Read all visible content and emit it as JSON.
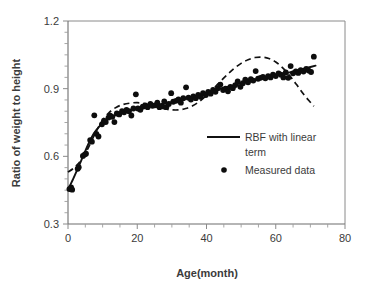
{
  "chart_data": {
    "type": "scatter",
    "title": "",
    "xlabel": "Age(month)",
    "ylabel": "Ratio of weight to height",
    "xlim": [
      0,
      80
    ],
    "ylim": [
      0.3,
      1.2
    ],
    "xticks": [
      0,
      20,
      40,
      60,
      80
    ],
    "xtick_labels": [
      "0",
      "20",
      "40",
      "60",
      "80"
    ],
    "xminor_step": 5,
    "yticks": [
      0.3,
      0.6,
      0.9,
      1.2
    ],
    "ytick_labels": [
      "0.3",
      "0.6",
      "0.9",
      "1.2"
    ],
    "yminor_step": 0.05,
    "grid": false,
    "legend_position": "center-right",
    "legend": [
      {
        "label": "RBF with linear term",
        "style": "line",
        "color": "#111111"
      },
      {
        "label": "Measured data",
        "style": "marker",
        "color": "#0d0d0d"
      }
    ],
    "series": [
      {
        "name": "Measured data",
        "style": "marker",
        "points": [
          [
            0.4,
            0.455
          ],
          [
            0.9,
            0.462
          ],
          [
            1.2,
            0.452
          ],
          [
            2.8,
            0.545
          ],
          [
            3.1,
            0.552
          ],
          [
            4.3,
            0.602
          ],
          [
            4.8,
            0.608
          ],
          [
            5.2,
            0.612
          ],
          [
            6.4,
            0.672
          ],
          [
            6.9,
            0.665
          ],
          [
            7.6,
            0.782
          ],
          [
            8.2,
            0.7
          ],
          [
            8.8,
            0.688
          ],
          [
            9.8,
            0.742
          ],
          [
            10.4,
            0.758
          ],
          [
            10.9,
            0.752
          ],
          [
            11.7,
            0.772
          ],
          [
            12.2,
            0.78
          ],
          [
            12.8,
            0.775
          ],
          [
            13.4,
            0.752
          ],
          [
            14.1,
            0.79
          ],
          [
            14.8,
            0.786
          ],
          [
            15.6,
            0.8
          ],
          [
            16.2,
            0.795
          ],
          [
            16.9,
            0.806
          ],
          [
            17.6,
            0.8
          ],
          [
            18.3,
            0.781
          ],
          [
            18.9,
            0.812
          ],
          [
            19.6,
            0.875
          ],
          [
            20.2,
            0.812
          ],
          [
            20.9,
            0.806
          ],
          [
            21.6,
            0.82
          ],
          [
            22.3,
            0.826
          ],
          [
            23.0,
            0.818
          ],
          [
            23.8,
            0.832
          ],
          [
            24.4,
            0.824
          ],
          [
            25.1,
            0.826
          ],
          [
            25.8,
            0.838
          ],
          [
            26.4,
            0.818
          ],
          [
            27.1,
            0.822
          ],
          [
            27.8,
            0.843
          ],
          [
            28.4,
            0.818
          ],
          [
            29.1,
            0.832
          ],
          [
            29.8,
            0.88
          ],
          [
            30.4,
            0.842
          ],
          [
            31.2,
            0.846
          ],
          [
            31.9,
            0.852
          ],
          [
            32.6,
            0.838
          ],
          [
            33.3,
            0.858
          ],
          [
            34.1,
            0.906
          ],
          [
            34.8,
            0.86
          ],
          [
            35.5,
            0.852
          ],
          [
            36.2,
            0.866
          ],
          [
            36.9,
            0.858
          ],
          [
            37.6,
            0.872
          ],
          [
            38.3,
            0.864
          ],
          [
            39.0,
            0.88
          ],
          [
            39.8,
            0.872
          ],
          [
            40.5,
            0.886
          ],
          [
            41.2,
            0.878
          ],
          [
            41.9,
            0.894
          ],
          [
            42.6,
            0.886
          ],
          [
            43.3,
            0.902
          ],
          [
            44.0,
            0.918
          ],
          [
            44.8,
            0.894
          ],
          [
            45.5,
            0.9
          ],
          [
            46.2,
            0.888
          ],
          [
            46.9,
            0.908
          ],
          [
            47.6,
            0.902
          ],
          [
            48.3,
            0.916
          ],
          [
            49.0,
            0.932
          ],
          [
            49.8,
            0.908
          ],
          [
            50.5,
            0.924
          ],
          [
            51.2,
            0.94
          ],
          [
            52.0,
            0.928
          ],
          [
            52.8,
            0.942
          ],
          [
            53.5,
            0.936
          ],
          [
            54.2,
            0.978
          ],
          [
            54.9,
            0.944
          ],
          [
            55.6,
            0.948
          ],
          [
            56.3,
            0.952
          ],
          [
            57.0,
            0.946
          ],
          [
            57.8,
            0.956
          ],
          [
            58.5,
            0.95
          ],
          [
            59.2,
            0.962
          ],
          [
            60.0,
            0.956
          ],
          [
            60.8,
            0.968
          ],
          [
            61.5,
            0.962
          ],
          [
            62.2,
            0.95
          ],
          [
            62.9,
            0.972
          ],
          [
            63.6,
            0.948
          ],
          [
            64.3,
            1.0
          ],
          [
            65.0,
            0.968
          ],
          [
            65.8,
            0.976
          ],
          [
            66.5,
            0.97
          ],
          [
            67.2,
            0.982
          ],
          [
            68.0,
            0.976
          ],
          [
            68.8,
            0.988
          ],
          [
            69.5,
            0.98
          ],
          [
            70.2,
            0.974
          ],
          [
            71.0,
            1.042
          ]
        ]
      },
      {
        "name": "RBF with linear term",
        "style": "solid-line",
        "points": [
          [
            0.0,
            0.452
          ],
          [
            1.5,
            0.5
          ],
          [
            3.0,
            0.552
          ],
          [
            4.5,
            0.606
          ],
          [
            6.0,
            0.658
          ],
          [
            7.5,
            0.702
          ],
          [
            9.0,
            0.732
          ],
          [
            10.5,
            0.754
          ],
          [
            12.0,
            0.77
          ],
          [
            14.0,
            0.784
          ],
          [
            16.0,
            0.794
          ],
          [
            18.0,
            0.804
          ],
          [
            20.0,
            0.812
          ],
          [
            22.0,
            0.82
          ],
          [
            24.0,
            0.826
          ],
          [
            26.0,
            0.83
          ],
          [
            28.0,
            0.834
          ],
          [
            30.0,
            0.84
          ],
          [
            32.0,
            0.848
          ],
          [
            34.0,
            0.856
          ],
          [
            36.0,
            0.864
          ],
          [
            38.0,
            0.872
          ],
          [
            40.0,
            0.88
          ],
          [
            42.0,
            0.89
          ],
          [
            44.0,
            0.9
          ],
          [
            46.0,
            0.908
          ],
          [
            48.0,
            0.916
          ],
          [
            50.0,
            0.924
          ],
          [
            52.0,
            0.932
          ],
          [
            54.0,
            0.94
          ],
          [
            56.0,
            0.948
          ],
          [
            58.0,
            0.954
          ],
          [
            60.0,
            0.96
          ],
          [
            62.0,
            0.966
          ],
          [
            64.0,
            0.972
          ],
          [
            66.0,
            0.98
          ],
          [
            68.0,
            0.988
          ],
          [
            70.0,
            0.996
          ],
          [
            71.5,
            1.002
          ]
        ]
      },
      {
        "name": "dashed-fit",
        "style": "dashed-line",
        "points": [
          [
            0.0,
            0.53
          ],
          [
            2.0,
            0.552
          ],
          [
            4.0,
            0.588
          ],
          [
            6.0,
            0.642
          ],
          [
            8.0,
            0.706
          ],
          [
            10.0,
            0.76
          ],
          [
            12.0,
            0.796
          ],
          [
            14.0,
            0.818
          ],
          [
            16.0,
            0.83
          ],
          [
            18.0,
            0.836
          ],
          [
            20.0,
            0.838
          ],
          [
            22.0,
            0.834
          ],
          [
            24.0,
            0.826
          ],
          [
            26.0,
            0.818
          ],
          [
            28.0,
            0.81
          ],
          [
            30.0,
            0.806
          ],
          [
            32.0,
            0.806
          ],
          [
            34.0,
            0.812
          ],
          [
            36.0,
            0.824
          ],
          [
            38.0,
            0.844
          ],
          [
            40.0,
            0.87
          ],
          [
            42.0,
            0.9
          ],
          [
            44.0,
            0.932
          ],
          [
            46.0,
            0.962
          ],
          [
            48.0,
            0.99
          ],
          [
            50.0,
            1.012
          ],
          [
            52.0,
            1.028
          ],
          [
            54.0,
            1.038
          ],
          [
            56.0,
            1.04
          ],
          [
            58.0,
            1.034
          ],
          [
            60.0,
            1.018
          ],
          [
            62.0,
            0.992
          ],
          [
            64.0,
            0.958
          ],
          [
            66.0,
            0.918
          ],
          [
            68.0,
            0.876
          ],
          [
            70.0,
            0.84
          ],
          [
            71.0,
            0.822
          ]
        ]
      }
    ]
  }
}
